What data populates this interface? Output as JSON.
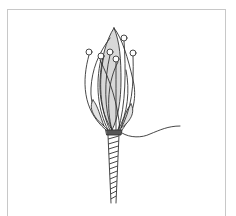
{
  "illustration": {
    "subject": "flower bud with stamens and wrapped stem",
    "stamen_count": 6,
    "colors": {
      "stroke": "#333333",
      "petal_fill": "#d8d8d8",
      "background": "#ffffff",
      "frame": "#c8c8c8"
    }
  }
}
